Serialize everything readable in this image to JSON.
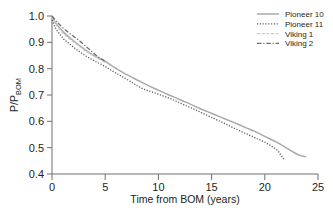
{
  "chart_data": {
    "type": "line",
    "title": "",
    "xlabel": "Time from BOM (years)",
    "ylabel": "P/P",
    "ylabel_sub": "BOM",
    "xlim": [
      0,
      25
    ],
    "ylim": [
      0.4,
      1.0
    ],
    "xticks": [
      "0",
      "5",
      "10",
      "15",
      "20",
      "25"
    ],
    "xtick_values": [
      0,
      5,
      10,
      15,
      20,
      25
    ],
    "yticks": [
      "0.4",
      "0.5",
      "0.6",
      "0.7",
      "0.8",
      "0.9",
      "1.0"
    ],
    "ytick_values": [
      0.4,
      0.5,
      0.6,
      0.7,
      0.8,
      0.9,
      1.0
    ],
    "grid": false,
    "legend_position": "top-right",
    "series": [
      {
        "name": "Pioneer 10",
        "style": "solid",
        "color": "#a7a9ac",
        "width": 1.5,
        "x": [
          0,
          0.3,
          0.7,
          1.1,
          1.6,
          2.1,
          2.6,
          3.1,
          3.6,
          4.1,
          4.6,
          5.1,
          5.6,
          6.2,
          6.8,
          7.4,
          8.0,
          8.6,
          9.2,
          9.8,
          10.4,
          11.0,
          11.6,
          12.2,
          12.8,
          13.4,
          14.0,
          14.6,
          15.2,
          15.8,
          16.4,
          17.0,
          17.6,
          18.2,
          18.8,
          19.4,
          20.0,
          20.6,
          21.2,
          21.8,
          22.4,
          23.0,
          23.5,
          23.9
        ],
        "y": [
          1.0,
          0.975,
          0.955,
          0.938,
          0.92,
          0.903,
          0.888,
          0.872,
          0.858,
          0.846,
          0.836,
          0.826,
          0.812,
          0.796,
          0.782,
          0.77,
          0.757,
          0.745,
          0.733,
          0.722,
          0.711,
          0.7,
          0.69,
          0.679,
          0.669,
          0.658,
          0.647,
          0.637,
          0.627,
          0.617,
          0.607,
          0.597,
          0.587,
          0.576,
          0.566,
          0.555,
          0.543,
          0.531,
          0.519,
          0.505,
          0.49,
          0.476,
          0.468,
          0.465
        ]
      },
      {
        "name": "Pioneer 11",
        "style": "dotted",
        "color": "#58595b",
        "width": 1.3,
        "x": [
          0,
          0.3,
          0.7,
          1.1,
          1.6,
          2.1,
          2.6,
          3.1,
          3.6,
          4.1,
          4.6,
          5.1,
          5.6,
          6.2,
          6.8,
          7.4,
          8.0,
          8.6,
          9.2,
          9.8,
          10.4,
          11.0,
          11.6,
          12.2,
          12.8,
          13.4,
          14.0,
          14.6,
          15.2,
          15.8,
          16.4,
          17.0,
          17.6,
          18.2,
          18.8,
          19.4,
          20.0,
          20.6,
          21.2,
          21.8
        ],
        "y": [
          0.985,
          0.955,
          0.932,
          0.912,
          0.895,
          0.879,
          0.864,
          0.85,
          0.838,
          0.827,
          0.817,
          0.806,
          0.793,
          0.779,
          0.765,
          0.751,
          0.735,
          0.722,
          0.714,
          0.706,
          0.697,
          0.688,
          0.678,
          0.667,
          0.656,
          0.645,
          0.634,
          0.622,
          0.611,
          0.6,
          0.588,
          0.576,
          0.565,
          0.554,
          0.543,
          0.532,
          0.521,
          0.507,
          0.49,
          0.455
        ]
      },
      {
        "name": "Viking 1",
        "style": "dashed-light",
        "color": "#c8c9cb",
        "width": 1.4,
        "x": [
          0,
          0.3,
          0.7,
          1.1,
          1.6,
          2.1,
          2.6,
          3.1,
          3.6,
          4.1,
          4.6,
          5.0
        ],
        "y": [
          1.0,
          0.972,
          0.95,
          0.932,
          0.915,
          0.899,
          0.884,
          0.869,
          0.856,
          0.845,
          0.833,
          0.824
        ]
      },
      {
        "name": "Viking 2",
        "style": "dashdot",
        "color": "#6d6e71",
        "width": 1.3,
        "x": [
          0,
          0.3,
          0.7,
          1.1,
          1.6,
          2.1,
          2.6,
          3.1,
          3.6,
          4.1,
          4.6,
          5.0
        ],
        "y": [
          1.0,
          0.985,
          0.968,
          0.952,
          0.936,
          0.92,
          0.905,
          0.888,
          0.87,
          0.852,
          0.838,
          0.828
        ]
      }
    ]
  },
  "legend": {
    "items": [
      {
        "label": "Pioneer 10"
      },
      {
        "label": "Pioneer 11"
      },
      {
        "label": "Viking 1"
      },
      {
        "label": "Viking 2"
      }
    ]
  }
}
